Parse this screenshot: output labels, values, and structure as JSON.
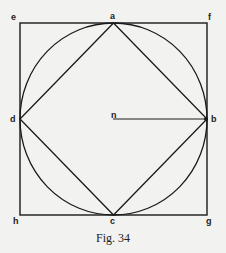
{
  "figure": {
    "caption": "Fig. 34",
    "stroke_color": "#1a1a1a",
    "background": "#f2f2f0",
    "labels": {
      "e": "e",
      "a": "a",
      "f": "f",
      "d": "d",
      "n": "n",
      "b": "b",
      "h": "h",
      "c": "c",
      "g": "g"
    },
    "shapes": {
      "square": "efgh",
      "circle": "inscribed circle, center n",
      "diamond": "abcd",
      "radius": "nb"
    }
  }
}
